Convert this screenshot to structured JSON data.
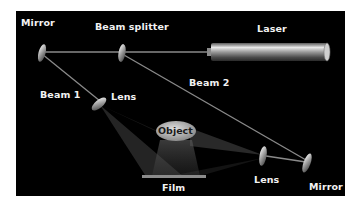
{
  "diagram": {
    "colors": {
      "background": "#000000",
      "beam": "#8a8a8a",
      "label": "#f2f2f2",
      "object_fill": "#bdbdbd",
      "film": "#8c8c8c"
    },
    "labels": {
      "mirror_top": "Mirror",
      "beam_splitter": "Beam splitter",
      "laser": "Laser",
      "beam1": "Beam 1",
      "beam2": "Beam 2",
      "lens_left": "Lens",
      "object": "Object",
      "film": "Film",
      "lens_right": "Lens",
      "mirror_bottom": "Mirror"
    }
  }
}
